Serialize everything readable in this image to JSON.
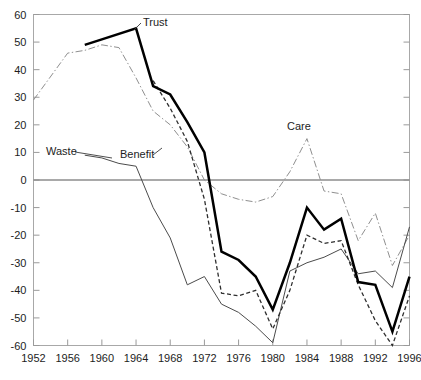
{
  "chart_data": {
    "type": "line",
    "title": "",
    "subtitle": "",
    "xlabel": "",
    "ylabel": "",
    "xlim": [
      1952,
      1996
    ],
    "ylim": [
      -60,
      60
    ],
    "grid": false,
    "legend_position": "inline-annotations",
    "x_ticks": [
      "1952",
      "1956",
      "1960",
      "1964",
      "1968",
      "1972",
      "1976",
      "1980",
      "1984",
      "1988",
      "1992",
      "1996"
    ],
    "y_ticks": [
      "60",
      "50",
      "40",
      "30",
      "20",
      "10",
      "0",
      "-10",
      "-20",
      "-30",
      "-40",
      "-50",
      "-60"
    ],
    "zero_reference_line": 0,
    "x": [
      1952,
      1954,
      1956,
      1958,
      1960,
      1962,
      1964,
      1966,
      1968,
      1970,
      1972,
      1974,
      1976,
      1978,
      1980,
      1982,
      1984,
      1986,
      1988,
      1990,
      1992,
      1994,
      1996
    ],
    "series": [
      {
        "name": "Trust",
        "label": "Trust",
        "style": "solid-thick",
        "color": "#000000",
        "x": [
          1958,
          1960,
          1964,
          1966,
          1968,
          1970,
          1972,
          1974,
          1976,
          1978,
          1980,
          1982,
          1984,
          1986,
          1988,
          1990,
          1992,
          1994,
          1996
        ],
        "values": [
          49,
          51,
          55,
          34,
          31,
          21,
          10,
          -26,
          -29,
          -35,
          -47,
          -30,
          -10,
          -18,
          -14,
          -37,
          -38,
          -55,
          -35
        ]
      },
      {
        "name": "Benefit",
        "label": "Benefit",
        "style": "dashed",
        "color": "#2e2e2e",
        "x": [
          1966,
          1968,
          1970,
          1972,
          1974,
          1976,
          1978,
          1980,
          1982,
          1984,
          1986,
          1988,
          1990,
          1992,
          1994,
          1996
        ],
        "values": [
          36,
          26,
          14,
          -7,
          -41,
          -42,
          -40,
          -54,
          -40,
          -20,
          -23,
          -22,
          -38,
          -51,
          -60,
          -42
        ]
      },
      {
        "name": "Waste",
        "label": "Waste",
        "style": "solid-thin",
        "color": "#4b4b4b",
        "x": [
          1958,
          1960,
          1962,
          1964,
          1966,
          1968,
          1970,
          1972,
          1974,
          1976,
          1978,
          1980,
          1982,
          1984,
          1986,
          1988,
          1990,
          1992,
          1994,
          1996
        ],
        "values": [
          9,
          8,
          6,
          5,
          -10,
          -21,
          -38,
          -35,
          -45,
          -48,
          -53,
          -59,
          -33,
          -30,
          -28,
          -25,
          -34,
          -33,
          -39,
          -17
        ]
      },
      {
        "name": "Care",
        "label": "Care",
        "style": "dash-dot",
        "color": "#8f8f8f",
        "x": [
          1952,
          1956,
          1958,
          1960,
          1962,
          1964,
          1966,
          1968,
          1970,
          1972,
          1974,
          1976,
          1978,
          1980,
          1982,
          1984,
          1986,
          1988,
          1990,
          1992,
          1994,
          1996
        ],
        "values": [
          29,
          46,
          47,
          49,
          48,
          37,
          25,
          20,
          12,
          0,
          -5,
          -7,
          -8,
          -6,
          3,
          15,
          -4,
          -5,
          -22,
          -12,
          -31,
          -20
        ]
      }
    ],
    "annotations": [
      {
        "name": "Trust",
        "text": "Trust",
        "x_px": 143,
        "y_px": 26
      },
      {
        "name": "Waste",
        "text": "Waste",
        "x_px": 46,
        "y_px": 155
      },
      {
        "name": "Benefit",
        "text": "Benefit",
        "x_px": 120,
        "y_px": 158
      },
      {
        "name": "Care",
        "text": "Care",
        "x_px": 287,
        "y_px": 130
      }
    ]
  },
  "axes": {
    "y_title": "",
    "x_title": ""
  }
}
